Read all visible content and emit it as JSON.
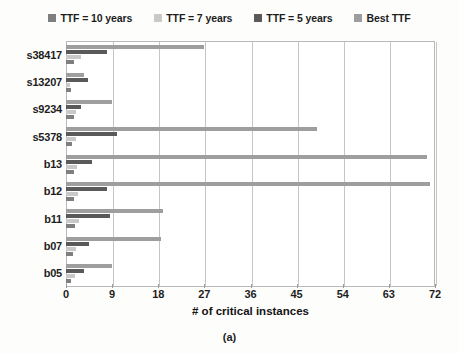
{
  "caption": "(a)",
  "chart_data": {
    "type": "bar",
    "orientation": "horizontal",
    "title": "",
    "xlabel": "# of critical instances",
    "ylabel": "",
    "xlim": [
      0,
      72
    ],
    "xticks": [
      0,
      9,
      18,
      27,
      36,
      45,
      54,
      63,
      72
    ],
    "grid": "vertical",
    "legend_position": "top-center",
    "categories": [
      "s38417",
      "s13207",
      "s9234",
      "s5378",
      "b13",
      "b12",
      "b11",
      "b07",
      "b05"
    ],
    "series": [
      {
        "name": "TTF = 10 years",
        "color": "#7f7f7f",
        "values": [
          1.5,
          1.0,
          1.5,
          1.2,
          1.5,
          1.5,
          1.8,
          1.3,
          1.0
        ]
      },
      {
        "name": "TTF = 7 years",
        "color": "#c9c9c9",
        "values": [
          3.0,
          0.8,
          2.0,
          2.0,
          2.2,
          2.3,
          2.5,
          2.0,
          1.8
        ]
      },
      {
        "name": "TTF = 5 years",
        "color": "#5a5a5a",
        "values": [
          8.0,
          4.3,
          3.0,
          10.0,
          5.0,
          8.0,
          8.5,
          4.5,
          3.5
        ]
      },
      {
        "name": "Best TTF",
        "color": "#9e9e9e",
        "values": [
          27.0,
          3.5,
          9.0,
          49.0,
          70.5,
          71.0,
          19.0,
          18.5,
          9.0
        ]
      }
    ],
    "legend": [
      {
        "label": "TTF = 10 years",
        "color": "#7f7f7f"
      },
      {
        "label": "TTF = 7 years",
        "color": "#c9c9c9"
      },
      {
        "label": "TTF = 5 years",
        "color": "#5a5a5a"
      },
      {
        "label": "Best TTF",
        "color": "#9e9e9e"
      }
    ]
  }
}
